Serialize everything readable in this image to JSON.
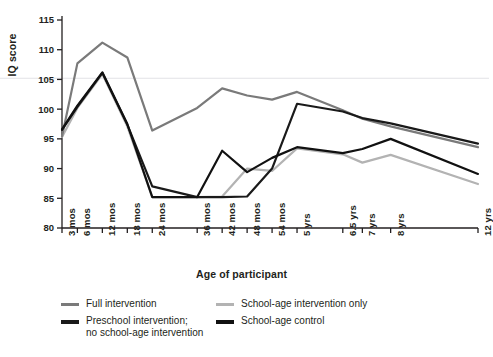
{
  "chart_data": {
    "type": "line",
    "title": "",
    "xlabel": "Age of participant",
    "ylabel": "IQ score",
    "ylim": [
      80,
      115
    ],
    "yticks": [
      80,
      85,
      90,
      95,
      100,
      105,
      110,
      115
    ],
    "grid": false,
    "legend_position": "bottom",
    "categories": [
      "3 mos",
      "6 mos",
      "12 mos",
      "18 mos",
      "24 mos",
      "36 mos",
      "42 mos",
      "48 mos",
      "54 mos",
      "5 yrs",
      "6.5 yrs",
      "7 yrs",
      "8 yrs",
      "12 yrs"
    ],
    "series": [
      {
        "name": "Full intervention",
        "color": "#7a7a7a",
        "width": 2.2,
        "values": [
          95.4,
          107.7,
          111.2,
          108.7,
          96.4,
          100.2,
          103.5,
          102.3,
          101.6,
          102.9,
          99.8,
          98.4,
          97.1,
          93.6
        ]
      },
      {
        "name": "Preschool intervention;\nno school-age intervention",
        "color": "#1a1a1a",
        "width": 2.2,
        "values": [
          96.5,
          100.4,
          106.1,
          97.4,
          87.0,
          85.2,
          85.2,
          85.3,
          90.0,
          100.9,
          99.6,
          98.5,
          97.6,
          94.2
        ]
      },
      {
        "name": "School-age intervention only",
        "color": "#b3b3b3",
        "width": 2.2,
        "values": [
          95.3,
          100.2,
          105.9,
          97.1,
          85.2,
          85.2,
          85.3,
          90.0,
          89.6,
          93.4,
          92.4,
          91.0,
          92.3,
          87.4
        ]
      },
      {
        "name": "School-age control",
        "color": "#111111",
        "width": 2.2,
        "values": [
          96.6,
          100.6,
          106.2,
          97.5,
          85.2,
          85.2,
          93.0,
          89.4,
          91.8,
          93.6,
          92.6,
          93.3,
          95.0,
          89.1
        ]
      }
    ]
  },
  "legend": {
    "items": [
      {
        "label": "Full intervention",
        "color": "#7a7a7a",
        "thickness": 3
      },
      {
        "label": "Preschool intervention;\nno school-age intervention",
        "color": "#1a1a1a",
        "thickness": 4
      },
      {
        "label": "School-age intervention only",
        "color": "#b3b3b3",
        "thickness": 3
      },
      {
        "label": "School-age control",
        "color": "#111111",
        "thickness": 4
      }
    ]
  },
  "axis": {
    "y_title": "IQ score",
    "x_title": "Age of participant"
  }
}
